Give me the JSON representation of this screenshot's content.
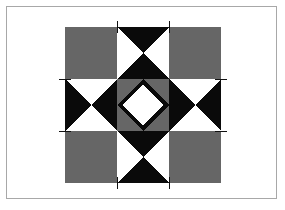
{
  "figure": {
    "name": "quilt-block-diagram",
    "pattern_type": "quilt-block",
    "grid": "3x3",
    "canvas": {
      "width": 285,
      "height": 210
    },
    "frame": {
      "x": 6,
      "y": 6,
      "width": 271,
      "height": 193,
      "border_color": "#a8a8a8",
      "fill": "#ffffff"
    },
    "block": {
      "x": 65,
      "y": 27,
      "size": 156,
      "cell": 52
    }
  },
  "colors": {
    "background": "#ffffff",
    "frame_border": "#a8a8a8",
    "dark": "#0a0a0a",
    "gray": "#666666",
    "light": "#ffffff",
    "registration_line": "#111111"
  },
  "cells": [
    {
      "row": 0,
      "col": 0,
      "name": "corner-square-top-left",
      "unit": "plain-square",
      "fill": "gray"
    },
    {
      "row": 0,
      "col": 1,
      "name": "hourglass-top-center",
      "unit": "hourglass-vertical",
      "fill": "dark-on-light"
    },
    {
      "row": 0,
      "col": 2,
      "name": "corner-square-top-right",
      "unit": "plain-square",
      "fill": "gray"
    },
    {
      "row": 1,
      "col": 0,
      "name": "hourglass-middle-left",
      "unit": "hourglass-horizontal",
      "fill": "dark-on-light"
    },
    {
      "row": 1,
      "col": 1,
      "name": "center-star-unit",
      "unit": "nested-diamond-star",
      "fill": "mixed"
    },
    {
      "row": 1,
      "col": 2,
      "name": "hourglass-middle-right",
      "unit": "hourglass-horizontal",
      "fill": "dark-on-light"
    },
    {
      "row": 2,
      "col": 0,
      "name": "corner-square-bottom-left",
      "unit": "plain-square",
      "fill": "gray"
    },
    {
      "row": 2,
      "col": 1,
      "name": "hourglass-bottom-center",
      "unit": "hourglass-vertical",
      "fill": "dark-on-light"
    },
    {
      "row": 2,
      "col": 2,
      "name": "corner-square-bottom-right",
      "unit": "plain-square",
      "fill": "gray"
    }
  ],
  "registration_lines": [
    {
      "name": "reg-line-top-left-vertical",
      "orientation": "vertical",
      "pos": 117,
      "from": 21,
      "to": 33
    },
    {
      "name": "reg-line-top-right-vertical",
      "orientation": "vertical",
      "pos": 169,
      "from": 21,
      "to": 33
    },
    {
      "name": "reg-line-bottom-left-vertical",
      "orientation": "vertical",
      "pos": 117,
      "from": 177,
      "to": 189
    },
    {
      "name": "reg-line-bottom-right-vertical",
      "orientation": "vertical",
      "pos": 169,
      "from": 177,
      "to": 189
    },
    {
      "name": "reg-line-left-top-horizontal",
      "orientation": "horizontal",
      "pos": 79,
      "from": 59,
      "to": 71
    },
    {
      "name": "reg-line-left-bottom-horizontal",
      "orientation": "horizontal",
      "pos": 131,
      "from": 59,
      "to": 71
    },
    {
      "name": "reg-line-right-top-horizontal",
      "orientation": "horizontal",
      "pos": 79,
      "from": 215,
      "to": 227
    },
    {
      "name": "reg-line-right-bottom-horizontal",
      "orientation": "horizontal",
      "pos": 131,
      "from": 215,
      "to": 227
    }
  ],
  "chart_data": {
    "type": "diagram",
    "palette": [
      "#ffffff",
      "#666666",
      "#0a0a0a"
    ],
    "units": [
      "plain-square",
      "hourglass-vertical",
      "hourglass-horizontal",
      "nested-diamond-star"
    ]
  }
}
